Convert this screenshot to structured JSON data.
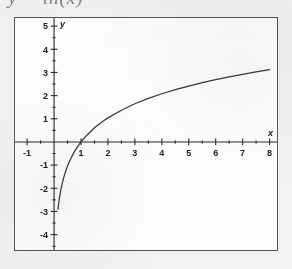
{
  "figure": {
    "formula_fragment": "y = ln(x)",
    "background_color": "#f2f2f0",
    "plot_background_color": "#fdfdfc",
    "frame_color": "#54545a",
    "curve_color": "#3a3a3f",
    "axis_color": "#2b2b2b"
  },
  "chart_data": {
    "type": "line",
    "title": "",
    "subtitle": "",
    "xlabel": "x",
    "ylabel": "y",
    "function": "y = 1.5 * ln(x)",
    "xlim": [
      -1.45,
      8.35
    ],
    "ylim": [
      -4.75,
      5.35
    ],
    "grid": false,
    "legend": null,
    "x_ticks_major": [
      -1,
      1,
      2,
      3,
      4,
      5,
      6,
      7,
      8
    ],
    "x_tick_labels": [
      "-1",
      "1",
      "2",
      "3",
      "4",
      "5",
      "6",
      "7",
      "8"
    ],
    "x_ticks_minor": [
      -1.5,
      -0.5,
      0.5,
      1.5,
      2.5,
      3.5,
      4.5,
      5.5,
      6.5,
      7.5
    ],
    "y_ticks_major": [
      5,
      4,
      3,
      2,
      1,
      -1,
      -2,
      -3,
      -4
    ],
    "y_tick_labels": [
      "5",
      "4",
      "3",
      "2",
      "1",
      "-1",
      "-2",
      "-3",
      "-4"
    ],
    "y_ticks_minor": [
      4.5,
      3.5,
      2.5,
      1.5,
      0.5,
      -0.5,
      -1.5,
      -2.5,
      -3.5,
      -4.5
    ],
    "axis_letter_x": "x",
    "axis_letter_y": "y",
    "x": [
      0.145,
      0.18,
      0.22,
      0.27,
      0.33,
      0.4,
      0.5,
      0.6,
      0.75,
      0.9,
      1.0,
      1.2,
      1.5,
      1.8,
      2.0,
      2.5,
      3.0,
      3.5,
      4.0,
      4.5,
      5.0,
      5.5,
      6.0,
      6.5,
      7.0,
      7.5,
      8.0
    ],
    "y": [
      -2.9,
      -2.57,
      -2.27,
      -1.96,
      -1.66,
      -1.37,
      -1.04,
      -0.77,
      -0.43,
      -0.16,
      0.0,
      0.27,
      0.61,
      0.88,
      1.04,
      1.37,
      1.65,
      1.88,
      2.08,
      2.26,
      2.41,
      2.56,
      2.69,
      2.81,
      2.92,
      3.02,
      3.12
    ],
    "annotations": []
  }
}
